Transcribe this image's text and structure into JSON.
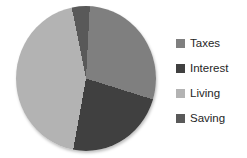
{
  "chart_data": {
    "type": "pie",
    "title": "",
    "categories": [
      "Taxes",
      "Interest",
      "Living",
      "Saving"
    ],
    "values": [
      29,
      23,
      44,
      4
    ],
    "colors": [
      "#7F7F7F",
      "#404040",
      "#B3B3B3",
      "#595959"
    ],
    "start_angle_deg": 3,
    "direction": "clockwise",
    "legend_position": "right",
    "background": "#FFFFFF"
  },
  "legend": {
    "items": [
      {
        "label": "Taxes",
        "color": "#7F7F7F"
      },
      {
        "label": "Interest",
        "color": "#404040"
      },
      {
        "label": "Living",
        "color": "#B3B3B3"
      },
      {
        "label": "Saving",
        "color": "#595959"
      }
    ]
  }
}
